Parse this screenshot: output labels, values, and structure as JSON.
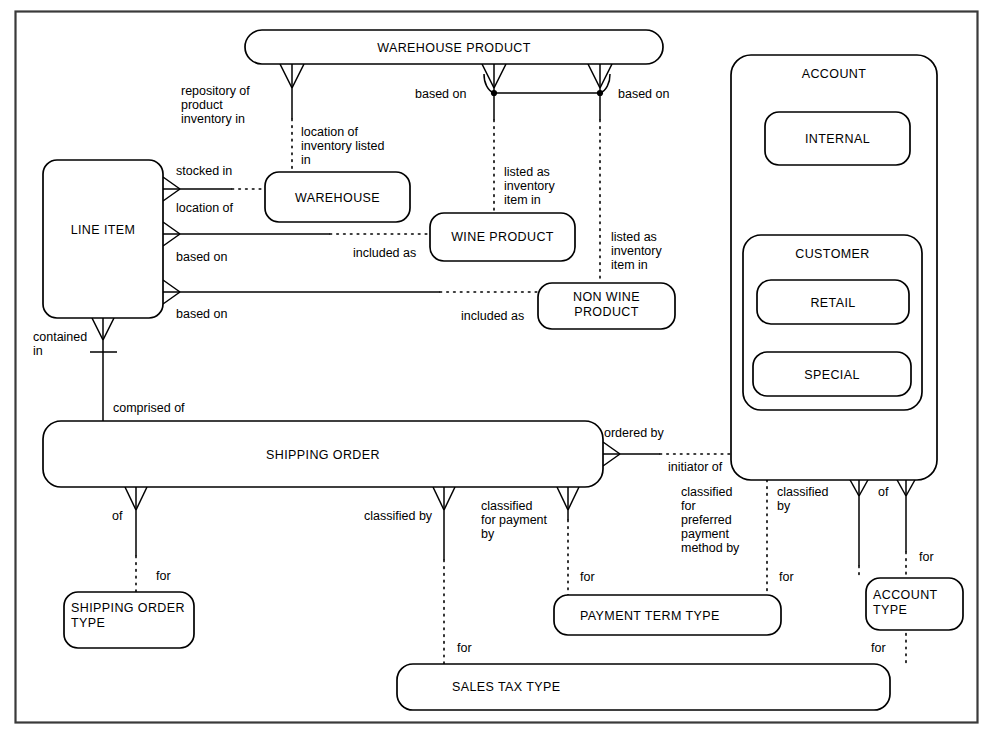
{
  "diagram": {
    "type": "entity-relationship-diagram",
    "entities": [
      {
        "id": "warehouse_product",
        "label": "WAREHOUSE PRODUCT",
        "align": "center"
      },
      {
        "id": "line_item",
        "label": "LINE ITEM",
        "align": "center"
      },
      {
        "id": "warehouse",
        "label": "WAREHOUSE",
        "align": "center"
      },
      {
        "id": "wine_product",
        "label": "WINE PRODUCT",
        "align": "center"
      },
      {
        "id": "non_wine_product",
        "label": "NON WINE PRODUCT",
        "align": "center"
      },
      {
        "id": "shipping_order",
        "label": "SHIPPING ORDER",
        "align": "center"
      },
      {
        "id": "account",
        "label": "ACCOUNT",
        "align": "center"
      },
      {
        "id": "internal",
        "label": "INTERNAL",
        "align": "center"
      },
      {
        "id": "customer",
        "label": "CUSTOMER",
        "align": "center"
      },
      {
        "id": "retail",
        "label": "RETAIL",
        "align": "center"
      },
      {
        "id": "special",
        "label": "SPECIAL",
        "align": "center"
      },
      {
        "id": "shipping_order_type",
        "label": "SHIPPING ORDER TYPE",
        "align": "left"
      },
      {
        "id": "payment_term_type",
        "label": "PAYMENT TERM TYPE",
        "align": "left"
      },
      {
        "id": "sales_tax_type",
        "label": "SALES TAX TYPE",
        "align": "left"
      },
      {
        "id": "account_type",
        "label": "ACCOUNT TYPE",
        "align": "left"
      }
    ],
    "entity_text": {
      "warehouse_product": "WAREHOUSE PRODUCT",
      "line_item": "LINE ITEM",
      "warehouse": "WAREHOUSE",
      "wine_product": "WINE PRODUCT",
      "non_wine_product_l1": "NON WINE",
      "non_wine_product_l2": "PRODUCT",
      "shipping_order": "SHIPPING ORDER",
      "account": "ACCOUNT",
      "internal": "INTERNAL",
      "customer": "CUSTOMER",
      "retail": "RETAIL",
      "special": "SPECIAL",
      "shipping_order_type_l1": "SHIPPING ORDER",
      "shipping_order_type_l2": "TYPE",
      "payment_term_type": "PAYMENT TERM TYPE",
      "sales_tax_type": "SALES TAX TYPE",
      "account_type_l1": "ACCOUNT",
      "account_type_l2": "TYPE"
    },
    "relationship_labels": {
      "repository_of_l1": "repository of",
      "repository_of_l2": "product",
      "repository_of_l3": "inventory in",
      "location_of_inventory_l1": "location of",
      "location_of_inventory_l2": "inventory listed",
      "location_of_inventory_l3": "in",
      "based_on_left": "based on",
      "based_on_right": "based on",
      "listed_as_inv_a_l1": "listed as",
      "listed_as_inv_a_l2": "inventory",
      "listed_as_inv_a_l3": "item in",
      "listed_as_inv_b_l1": "listed as",
      "listed_as_inv_b_l2": "inventory",
      "listed_as_inv_b_l3": "item in",
      "stocked_in": "stocked in",
      "location_of": "location of",
      "li_based_on_1": "based on",
      "li_based_on_2": "based on",
      "included_as_1": "included as",
      "included_as_2": "included as",
      "contained_in_l1": "contained",
      "contained_in_l2": "in",
      "comprised_of": "comprised of",
      "of_sot": "of",
      "classified_by_stax": "classified by",
      "classified_for_payment_l1": "classified",
      "classified_for_payment_l2": "for payment",
      "classified_for_payment_l3": "by",
      "ordered_by": "ordered by",
      "initiator_of": "initiator of",
      "classified_pref_l1": "classified",
      "classified_pref_l2": "for",
      "classified_pref_l3": "preferred",
      "classified_pref_l4": "payment",
      "classified_pref_l5": "method by",
      "classified_by_acct_l1": "classified",
      "classified_by_acct_l2": "by",
      "of_account": "of",
      "for_sot": "for",
      "for_stax_left": "for",
      "for_ptt": "for",
      "for_ptt_right": "for",
      "for_acct_type": "for",
      "for_stax_right": "for"
    },
    "colors": {
      "stroke": "#000000",
      "frame": "#3a3a3a",
      "background": "#ffffff"
    }
  }
}
